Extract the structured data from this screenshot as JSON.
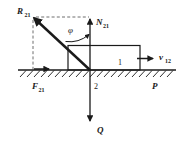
{
  "diagram": {
    "background_color": "#ffffff",
    "line_color": "#1a1a1a",
    "dash_color": "#4a4a4a"
  },
  "labels": {
    "reaction": {
      "symbol": "R",
      "subscript": "21"
    },
    "normal": {
      "symbol": "N",
      "subscript": "21"
    },
    "friction": {
      "symbol": "F",
      "subscript": "21"
    },
    "velocity": {
      "symbol": "v",
      "subscript": "12"
    },
    "weight": {
      "symbol": "Q",
      "subscript": ""
    },
    "angle": {
      "symbol": "φ"
    },
    "body_one": {
      "text": "1"
    },
    "body_two": {
      "text": "2"
    },
    "point_p": {
      "symbol": "P",
      "subscript": ""
    }
  },
  "geometry": {
    "origin_x": 90,
    "origin_y": 70,
    "ground_y": 70,
    "ground_x_start": 18,
    "ground_x_end": 176,
    "block_left": 68,
    "block_right": 140,
    "block_top": 45,
    "normal_tip_y": 18,
    "weight_tip_y": 122,
    "reaction_tip_x": 33,
    "reaction_tip_y": 17
  }
}
